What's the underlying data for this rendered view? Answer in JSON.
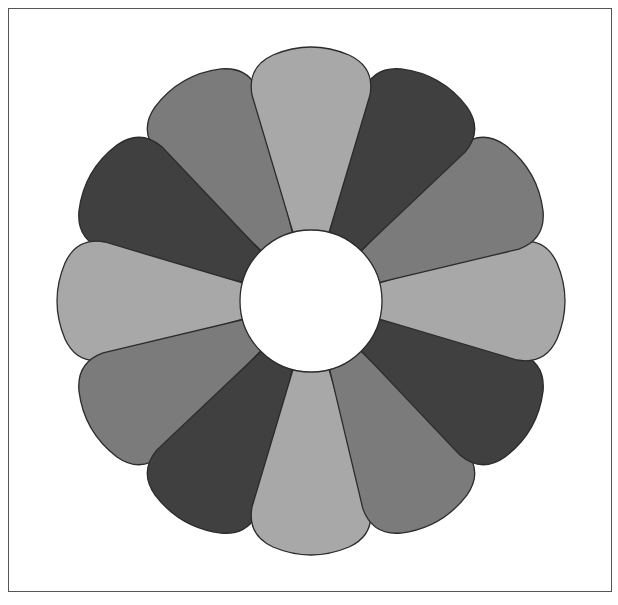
{
  "figure": {
    "title": "",
    "petal_count": 12,
    "center": {
      "x": 311,
      "y": 301
    },
    "hub_radius": 71,
    "petal_outer_radius": 255,
    "colors": {
      "light": "#a8a8a8",
      "medium": "#7b7b7b",
      "dark": "#404040",
      "outline": "#2b2b2b",
      "hub": "#ffffff",
      "frame": "#555555"
    },
    "petals": [
      {
        "angle": 0,
        "shade": "light"
      },
      {
        "angle": 30,
        "shade": "dark"
      },
      {
        "angle": 60,
        "shade": "medium"
      },
      {
        "angle": 90,
        "shade": "light"
      },
      {
        "angle": 120,
        "shade": "dark"
      },
      {
        "angle": 150,
        "shade": "medium"
      },
      {
        "angle": 180,
        "shade": "light"
      },
      {
        "angle": 210,
        "shade": "dark"
      },
      {
        "angle": 240,
        "shade": "medium"
      },
      {
        "angle": 270,
        "shade": "light"
      },
      {
        "angle": 300,
        "shade": "dark"
      },
      {
        "angle": 330,
        "shade": "medium"
      }
    ]
  }
}
